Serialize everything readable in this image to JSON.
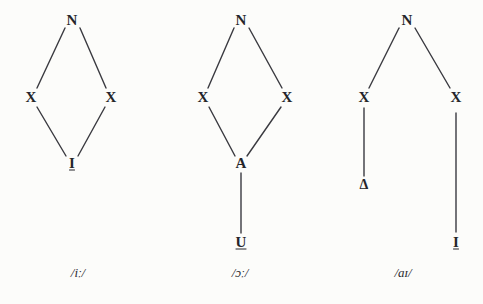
{
  "figure": {
    "background_color": "#fcfcfa",
    "ink_color": "#25252a",
    "line_color": "#3a3a40"
  },
  "trees": [
    {
      "id": "tree-ii",
      "caption": "/iː/",
      "caption_x": 78,
      "caption_y": 272,
      "nodes": [
        {
          "name": "nucleus",
          "label": "N",
          "x": 72,
          "y": 20,
          "underlined": false
        },
        {
          "name": "skeletal-point-left",
          "label": "X",
          "x": 31,
          "y": 97,
          "underlined": false
        },
        {
          "name": "skeletal-point-right",
          "label": "X",
          "x": 111,
          "y": 97,
          "underlined": false
        },
        {
          "name": "element-i",
          "label": "I",
          "x": 72,
          "y": 163,
          "underlined": true
        }
      ],
      "edges": [
        {
          "name": "edge-n-to-left-x",
          "x1": 65,
          "y1": 28,
          "x2": 37,
          "y2": 88
        },
        {
          "name": "edge-n-to-right-x",
          "x1": 80,
          "y1": 28,
          "x2": 106,
          "y2": 88
        },
        {
          "name": "edge-left-x-to-element",
          "x1": 37,
          "y1": 107,
          "x2": 66,
          "y2": 156
        },
        {
          "name": "edge-right-x-to-element",
          "x1": 105,
          "y1": 107,
          "x2": 78,
          "y2": 156
        }
      ]
    },
    {
      "id": "tree-oo",
      "caption": "/ɔː/",
      "caption_x": 240,
      "caption_y": 272,
      "nodes": [
        {
          "name": "nucleus",
          "label": "N",
          "x": 241,
          "y": 20,
          "underlined": false
        },
        {
          "name": "skeletal-point-left",
          "label": "X",
          "x": 203,
          "y": 97,
          "underlined": false
        },
        {
          "name": "skeletal-point-right",
          "label": "X",
          "x": 287,
          "y": 97,
          "underlined": false
        },
        {
          "name": "element-a",
          "label": "A",
          "x": 241,
          "y": 163,
          "underlined": false
        },
        {
          "name": "element-u",
          "label": "U",
          "x": 241,
          "y": 242,
          "underlined": true
        }
      ],
      "edges": [
        {
          "name": "edge-n-to-left-x",
          "x1": 234,
          "y1": 28,
          "x2": 208,
          "y2": 88
        },
        {
          "name": "edge-n-to-right-x",
          "x1": 249,
          "y1": 28,
          "x2": 282,
          "y2": 88
        },
        {
          "name": "edge-left-x-to-a",
          "x1": 209,
          "y1": 107,
          "x2": 235,
          "y2": 156
        },
        {
          "name": "edge-right-x-to-a",
          "x1": 281,
          "y1": 107,
          "x2": 247,
          "y2": 156
        },
        {
          "name": "edge-a-to-u",
          "x1": 241,
          "y1": 173,
          "x2": 241,
          "y2": 233
        }
      ]
    },
    {
      "id": "tree-ai",
      "caption": "/aɪ/",
      "caption_x": 403,
      "caption_y": 272,
      "nodes": [
        {
          "name": "nucleus",
          "label": "N",
          "x": 407,
          "y": 20,
          "underlined": false
        },
        {
          "name": "skeletal-point-left",
          "label": "X",
          "x": 364,
          "y": 97,
          "underlined": false
        },
        {
          "name": "skeletal-point-right",
          "label": "X",
          "x": 456,
          "y": 97,
          "underlined": false
        },
        {
          "name": "element-cold-vowel",
          "label": "Δ",
          "x": 364,
          "y": 185,
          "underlined": false
        },
        {
          "name": "element-i",
          "label": "I",
          "x": 456,
          "y": 242,
          "underlined": true
        }
      ],
      "edges": [
        {
          "name": "edge-n-to-left-x",
          "x1": 399,
          "y1": 28,
          "x2": 369,
          "y2": 88
        },
        {
          "name": "edge-n-to-right-x",
          "x1": 415,
          "y1": 28,
          "x2": 450,
          "y2": 88
        },
        {
          "name": "edge-left-x-to-cold-vowel",
          "x1": 364,
          "y1": 108,
          "x2": 364,
          "y2": 176
        },
        {
          "name": "edge-right-x-to-element",
          "x1": 456,
          "y1": 113,
          "x2": 456,
          "y2": 232
        }
      ]
    }
  ]
}
